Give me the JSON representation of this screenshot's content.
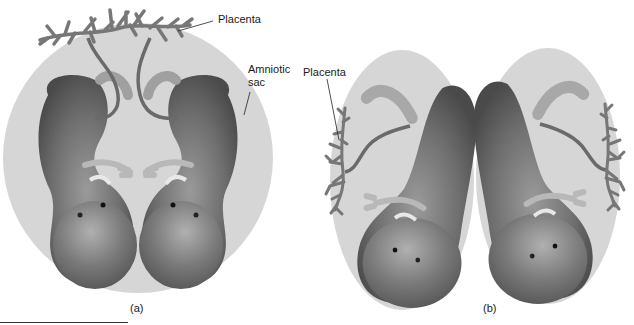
{
  "figure": {
    "panel_a": {
      "caption": "(a)",
      "labels": {
        "placenta": "Placenta",
        "amniotic_sac_line1": "Amniotic",
        "amniotic_sac_line2": "sac"
      },
      "description": "Twins sharing one amniotic sac and one placenta"
    },
    "panel_b": {
      "caption": "(b)",
      "labels": {
        "placenta": "Placenta"
      },
      "description": "Twins each with separate amniotic sac and separate placenta"
    }
  },
  "colors": {
    "background": "#ffffff",
    "amniotic_sac": "#d6d6d6",
    "fetus_dark": "#5e5e5e",
    "fetus_light": "#a8a8a8",
    "placenta": "#7a7a7a",
    "text": "#1a1a1a"
  }
}
